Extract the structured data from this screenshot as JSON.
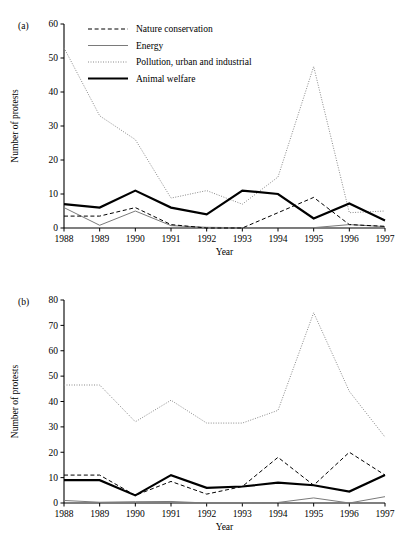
{
  "figure": {
    "panel_a_label": "(a)",
    "panel_b_label": "(b)",
    "xlabel": "Year",
    "ylabel": "Number of protests"
  },
  "legend": {
    "position": "top-center-inside-panel-a",
    "entries": [
      {
        "label": "Nature conservation",
        "style": "dashed",
        "color": "#000000",
        "width": 1.0
      },
      {
        "label": "Energy",
        "style": "solid",
        "color": "#7a7a7a",
        "width": 1.0
      },
      {
        "label": "Pollution, urban and industrial",
        "style": "dotted",
        "color": "#8a8a8a",
        "width": 1.0
      },
      {
        "label": "Animal welfare",
        "style": "solid",
        "color": "#000000",
        "width": 2.2
      }
    ]
  },
  "chart_data": [
    {
      "type": "line",
      "panel": "(a)",
      "title": "",
      "xlabel": "Year",
      "ylabel": "Number of protests",
      "categories": [
        "1988",
        "1989",
        "1990",
        "1991",
        "1992",
        "1993",
        "1994",
        "1995",
        "1996",
        "1997"
      ],
      "x": [
        1988,
        1989,
        1990,
        1991,
        1992,
        1993,
        1994,
        1995,
        1996,
        1997
      ],
      "xlim": [
        1988,
        1997
      ],
      "ylim": [
        0,
        60
      ],
      "yticks": [
        0,
        10,
        20,
        30,
        40,
        50,
        60
      ],
      "grid": false,
      "series": [
        {
          "name": "Nature conservation",
          "style": "dashed",
          "color": "#000000",
          "width": 1.0,
          "values": [
            3.5,
            3.5,
            6.0,
            1.0,
            0.0,
            0.0,
            4.5,
            9.0,
            1.0,
            0.5
          ]
        },
        {
          "name": "Energy",
          "style": "solid",
          "color": "#7a7a7a",
          "width": 1.0,
          "values": [
            6.0,
            0.8,
            5.0,
            0.7,
            0.2,
            0.1,
            0.1,
            0.1,
            1.0,
            0.4
          ]
        },
        {
          "name": "Pollution, urban and industrial",
          "style": "dotted",
          "color": "#8a8a8a",
          "width": 1.0,
          "values": [
            53.0,
            33.0,
            26.0,
            8.8,
            11.0,
            7.0,
            15.0,
            47.5,
            4.5,
            5.0
          ]
        },
        {
          "name": "Animal welfare",
          "style": "solid",
          "color": "#000000",
          "width": 2.2,
          "values": [
            7.0,
            6.0,
            11.0,
            6.0,
            4.0,
            11.0,
            10.0,
            2.8,
            7.2,
            2.2
          ]
        }
      ]
    },
    {
      "type": "line",
      "panel": "(b)",
      "title": "",
      "xlabel": "Year",
      "ylabel": "Number of protests",
      "categories": [
        "1988",
        "1989",
        "1990",
        "1991",
        "1992",
        "1993",
        "1994",
        "1995",
        "1996",
        "1997"
      ],
      "x": [
        1988,
        1989,
        1990,
        1991,
        1992,
        1993,
        1994,
        1995,
        1996,
        1997
      ],
      "xlim": [
        1988,
        1997
      ],
      "ylim": [
        0,
        80
      ],
      "yticks": [
        0,
        10,
        20,
        30,
        40,
        50,
        60,
        70,
        80
      ],
      "grid": false,
      "series": [
        {
          "name": "Nature conservation",
          "style": "dashed",
          "color": "#000000",
          "width": 1.0,
          "values": [
            11.0,
            11.0,
            3.0,
            8.5,
            3.5,
            6.5,
            18.0,
            7.0,
            20.0,
            11.0
          ]
        },
        {
          "name": "Energy",
          "style": "solid",
          "color": "#7a7a7a",
          "width": 1.0,
          "values": [
            1.0,
            0.3,
            0.5,
            0.6,
            0.0,
            0.0,
            0.2,
            2.0,
            0.0,
            2.5
          ]
        },
        {
          "name": "Pollution, urban and industrial",
          "style": "dotted",
          "color": "#8a8a8a",
          "width": 1.0,
          "values": [
            46.5,
            46.5,
            32.0,
            40.5,
            31.5,
            31.5,
            36.5,
            75.0,
            44.0,
            26.0
          ]
        },
        {
          "name": "Animal welfare",
          "style": "solid",
          "color": "#000000",
          "width": 2.2,
          "values": [
            9.0,
            9.0,
            3.0,
            11.0,
            6.0,
            6.5,
            8.0,
            7.0,
            4.5,
            11.0
          ]
        }
      ]
    }
  ]
}
